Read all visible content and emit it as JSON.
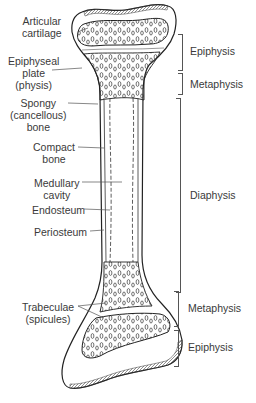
{
  "diagram": {
    "left_labels": [
      {
        "id": "articular-cartilage",
        "lines": [
          "Articular",
          "cartilage"
        ]
      },
      {
        "id": "epiphyseal-plate",
        "lines": [
          "Epiphyseal",
          "plate",
          "(physis)"
        ]
      },
      {
        "id": "spongy-bone",
        "lines": [
          "Spongy",
          "(cancellous)",
          "bone"
        ]
      },
      {
        "id": "compact-bone",
        "lines": [
          "Compact",
          "bone"
        ]
      },
      {
        "id": "medullary-cavity",
        "lines": [
          "Medullary",
          "cavity"
        ]
      },
      {
        "id": "endosteum",
        "lines": [
          "Endosteum"
        ]
      },
      {
        "id": "periosteum",
        "lines": [
          "Periosteum"
        ]
      },
      {
        "id": "trabeculae",
        "lines": [
          "Trabeculae",
          "(spicules)"
        ]
      }
    ],
    "right_regions": [
      {
        "id": "epiphysis-top",
        "label": "Epiphysis"
      },
      {
        "id": "metaphysis-top",
        "label": "Metaphysis"
      },
      {
        "id": "diaphysis",
        "label": "Diaphysis"
      },
      {
        "id": "metaphysis-bottom",
        "label": "Metaphysis"
      },
      {
        "id": "epiphysis-bottom",
        "label": "Epiphysis"
      }
    ]
  }
}
